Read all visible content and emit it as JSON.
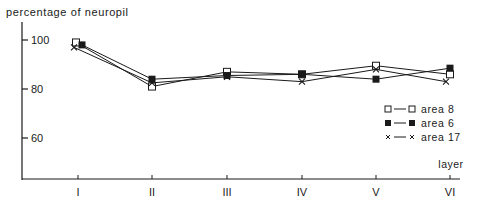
{
  "chart_data": {
    "type": "line",
    "title": "",
    "ylabel": "percentage of neuropil",
    "xlabel": "layer",
    "categories": [
      "I",
      "II",
      "III",
      "IV",
      "V",
      "VI"
    ],
    "yticks": [
      60,
      80,
      100
    ],
    "ylim": [
      44,
      104
    ],
    "grid": false,
    "legend_position": "right",
    "series": [
      {
        "name": "area 8",
        "marker": "open-square",
        "values": [
          99,
          81,
          87,
          86,
          89.5,
          86
        ]
      },
      {
        "name": "area 6",
        "marker": "filled-square",
        "values": [
          98,
          84,
          85.5,
          86,
          84,
          88.5
        ]
      },
      {
        "name": "area 17",
        "marker": "cross",
        "values": [
          97,
          82.5,
          85,
          83,
          88,
          83
        ]
      }
    ]
  },
  "axes": {
    "ylabel": "percentage of neuropil",
    "xlabel": "layer",
    "ytick_labels": [
      "100",
      "80",
      "60"
    ],
    "xtick_labels": [
      "I",
      "II",
      "III",
      "IV",
      "V",
      "VI"
    ]
  },
  "legend": [
    {
      "label": "area 8",
      "marker": "open-square"
    },
    {
      "label": "area 6",
      "marker": "filled-square"
    },
    {
      "label": "area 17",
      "marker": "cross"
    }
  ],
  "colors": {
    "ink": "#1a1a1a",
    "background": "#ffffff"
  }
}
